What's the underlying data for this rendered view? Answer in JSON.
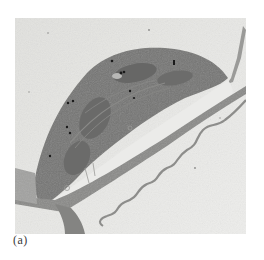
{
  "figure": {
    "panel_label": "(a)",
    "image_description": "transmission-electron-micrograph",
    "colors": {
      "background": "#e4e4e2",
      "organelle": "#7a7a78",
      "organelle_dark": "#626261",
      "wall": "#8c8c8a",
      "vacuole": "#ececea",
      "particles": "#1a1a1a"
    }
  }
}
